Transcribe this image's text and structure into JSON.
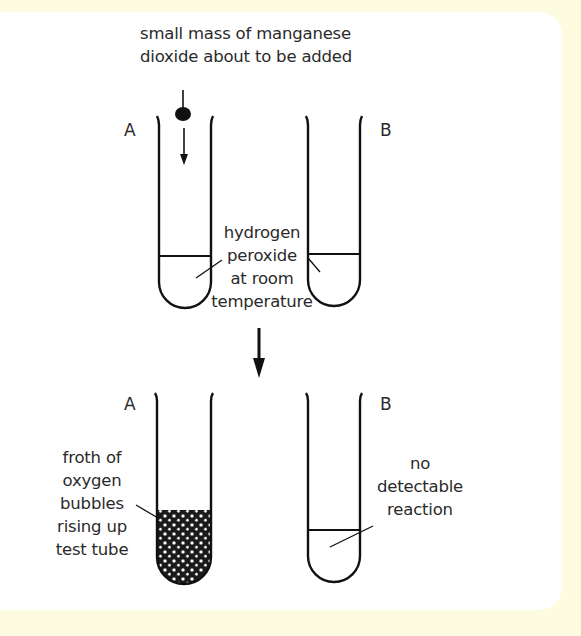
{
  "diagram": {
    "before": {
      "top_label_line1": "small mass of manganese",
      "top_label_line2": "dioxide about to be added",
      "tube_a_letter": "A",
      "tube_b_letter": "B",
      "liquid_label_line1": "hydrogen",
      "liquid_label_line2": "peroxide",
      "liquid_label_line3": "at room",
      "liquid_label_line4": "temperature"
    },
    "after": {
      "tube_a_letter": "A",
      "tube_b_letter": "B",
      "froth_label_line1": "froth of",
      "froth_label_line2": "oxygen",
      "froth_label_line3": "bubbles",
      "froth_label_line4": "rising up",
      "froth_label_line5": "test tube",
      "no_reaction_line1": "no",
      "no_reaction_line2": "detectable",
      "no_reaction_line3": "reaction"
    },
    "colors": {
      "background": "#fdfbe0",
      "panel": "#ffffff",
      "ink": "#111111",
      "text": "#2a2a2a"
    }
  }
}
